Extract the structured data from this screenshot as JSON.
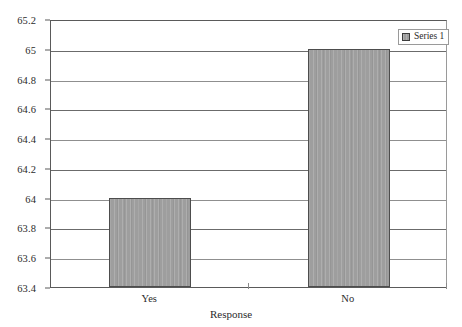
{
  "chart_data": {
    "type": "bar",
    "title": "",
    "xlabel": "Response",
    "ylabel": "",
    "categories": [
      "Yes",
      "No"
    ],
    "values": [
      64,
      65
    ],
    "series": [
      {
        "name": "Series 1",
        "values": [
          64,
          65
        ]
      }
    ],
    "ylim": [
      63.4,
      65.2
    ],
    "yticks": [
      65.2,
      65,
      64.8,
      64.6,
      64.4,
      64.2,
      64,
      63.8,
      63.6,
      63.4
    ],
    "ytick_labels": [
      "65.2",
      "65",
      "64.8",
      "64.6",
      "64.4",
      "64.2",
      "64",
      "63.8",
      "63.6",
      "63.4"
    ],
    "grid": true,
    "legend": {
      "position": "top-right",
      "entries": [
        "Series 1"
      ]
    },
    "colors": {
      "bar_fill": "#9e9e9e",
      "bar_border": "#4d4d4d",
      "gridline": "#6b6b6b",
      "axis": "#5a5a5a",
      "text": "#2b2b2b",
      "background": "#ffffff"
    }
  }
}
